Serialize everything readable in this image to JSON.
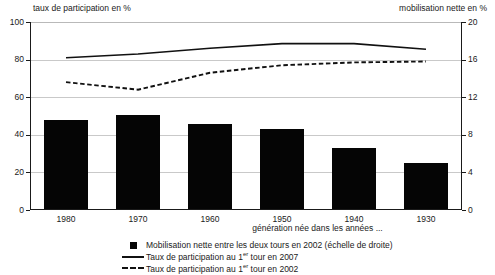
{
  "chart_data": {
    "type": "bar",
    "title": "",
    "categories": [
      "1980",
      "1970",
      "1960",
      "1950",
      "1940",
      "1930"
    ],
    "xlabel": "génération née dans les années ...",
    "ylabel_left": "taux de participation en %",
    "ylabel_right": "mobilisation nette en %",
    "ylim_left": [
      0,
      100
    ],
    "ylim_right": [
      0,
      20
    ],
    "yticks_left": [
      0,
      20,
      40,
      60,
      80,
      100
    ],
    "yticks_right": [
      0,
      4,
      8,
      12,
      16,
      20
    ],
    "grid": true,
    "legend_position": "bottom",
    "series": [
      {
        "name": "Mobilisation nette entre les deux tours en 2002 (échelle de droite)",
        "type": "bar",
        "axis": "right",
        "values": [
          9.6,
          10.1,
          9.2,
          8.6,
          6.6,
          5.0
        ]
      },
      {
        "name": "Taux de participation au 1er tour en 2007",
        "type": "line",
        "style": "solid",
        "axis": "left",
        "values": [
          81,
          83,
          86,
          88.5,
          88.5,
          85.5
        ]
      },
      {
        "name": "Taux de participation au 1er tour en 2002",
        "type": "line",
        "style": "dashed",
        "axis": "left",
        "values": [
          68,
          64,
          73,
          77,
          78.5,
          79
        ]
      }
    ]
  },
  "axis_captions": {
    "left": "taux de participation en %",
    "right": "mobilisation nette en %"
  },
  "legend": {
    "items": [
      {
        "key": "filled-square",
        "label_prefix": "Mobilisation nette entre les deux tours en 2002 (échelle de droite)",
        "sup": "",
        "label_suffix": ""
      },
      {
        "key": "solid-line",
        "label_prefix": "Taux de participation au 1",
        "sup": "er",
        "label_suffix": " tour en 2007"
      },
      {
        "key": "dashed-line",
        "label_prefix": "Taux de participation au 1",
        "sup": "er",
        "label_suffix": " tour en 2002"
      }
    ]
  },
  "colors": {
    "bar": "#050505",
    "line": "#111111",
    "grid": "#c9c9c9",
    "axis": "#1a1a1a",
    "background": "#ffffff"
  }
}
